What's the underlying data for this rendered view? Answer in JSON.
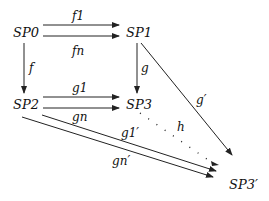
{
  "diagram": {
    "type": "commutative-diagram",
    "nodes": {
      "sp0": "SP0",
      "sp1": "SP1",
      "sp2": "SP2",
      "sp3": "SP3",
      "sp3p": "SP3′"
    },
    "edges": {
      "f1": "f1",
      "fn": "fn",
      "f": "f",
      "g": "g",
      "gprime": "g′",
      "g1": "g1",
      "gn": "gn",
      "g1prime": "g1′",
      "gnprime": "gn′",
      "h": "h"
    }
  }
}
